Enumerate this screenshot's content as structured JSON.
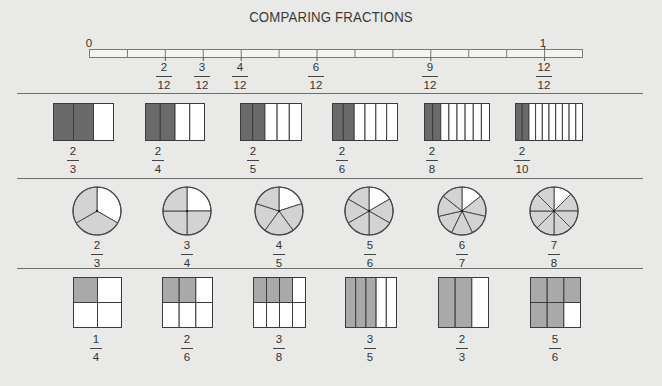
{
  "title": "COMPARING FRACTIONS",
  "colors": {
    "background": "#e9e9e7",
    "dark_shade": "#6a6a6a",
    "medium_shade": "#a9a9a9",
    "light_shade": "#d3d3d3",
    "empty": "#ffffff",
    "outline": "#555555"
  },
  "number_line": {
    "start_label": "0",
    "end_label": "1",
    "segments": 13,
    "denominator": 12,
    "marked": [
      {
        "num": "2",
        "den": "12"
      },
      {
        "num": "3",
        "den": "12"
      },
      {
        "num": "4",
        "den": "12"
      },
      {
        "num": "6",
        "den": "12"
      },
      {
        "num": "9",
        "den": "12"
      },
      {
        "num": "12",
        "den": "12"
      }
    ]
  },
  "bar_models": [
    {
      "num": "2",
      "den": "3",
      "shaded": 2,
      "parts": 3
    },
    {
      "num": "2",
      "den": "4",
      "shaded": 2,
      "parts": 4
    },
    {
      "num": "2",
      "den": "5",
      "shaded": 2,
      "parts": 5
    },
    {
      "num": "2",
      "den": "6",
      "shaded": 2,
      "parts": 6
    },
    {
      "num": "2",
      "den": "8",
      "shaded": 2,
      "parts": 8
    },
    {
      "num": "2",
      "den": "10",
      "shaded": 2,
      "parts": 10
    }
  ],
  "pie_models": [
    {
      "num": "2",
      "den": "3",
      "shaded": 2,
      "parts": 3
    },
    {
      "num": "3",
      "den": "4",
      "shaded": 3,
      "parts": 4
    },
    {
      "num": "4",
      "den": "5",
      "shaded": 4,
      "parts": 5
    },
    {
      "num": "5",
      "den": "6",
      "shaded": 5,
      "parts": 6
    },
    {
      "num": "6",
      "den": "7",
      "shaded": 6,
      "parts": 7
    },
    {
      "num": "7",
      "den": "8",
      "shaded": 7,
      "parts": 8
    }
  ],
  "grid_models": [
    {
      "num": "1",
      "den": "4",
      "layout": "2x2",
      "shaded": 1
    },
    {
      "num": "2",
      "den": "6",
      "layout": "3x2",
      "shaded": 2
    },
    {
      "num": "3",
      "den": "8",
      "layout": "4x2",
      "shaded": 3
    },
    {
      "num": "3",
      "den": "5",
      "layout": "5x1",
      "shaded": 3
    },
    {
      "num": "2",
      "den": "3",
      "layout": "3x1",
      "shaded": 2
    },
    {
      "num": "5",
      "den": "6",
      "layout": "3x2",
      "shaded": 5
    }
  ]
}
